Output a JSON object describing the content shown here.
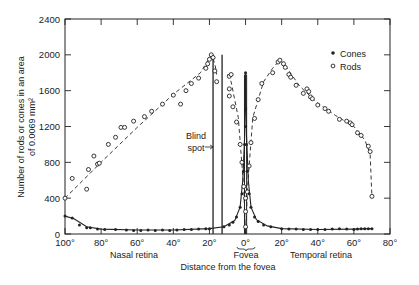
{
  "chart_data": {
    "type": "scatter",
    "title": "",
    "xlabel": "Distance from the fovea",
    "ylabel": "Number of rods or cones in an area of 0.0069 mm²",
    "ylabel_lines": [
      "Number of rods or cones in an area",
      "of 0.0069 mm²"
    ],
    "xlim": [
      -100,
      80
    ],
    "ylim": [
      0,
      2400
    ],
    "x_ticks": [
      {
        "value": -100,
        "label": "100°"
      },
      {
        "value": -80,
        "label": "80°"
      },
      {
        "value": -60,
        "label": "60°"
      },
      {
        "value": -40,
        "label": "40°"
      },
      {
        "value": -20,
        "label": "20°"
      },
      {
        "value": 0,
        "label": "0°"
      },
      {
        "value": 20,
        "label": "20°"
      },
      {
        "value": 40,
        "label": "40°"
      },
      {
        "value": 60,
        "label": "60°"
      },
      {
        "value": 80,
        "label": "80°"
      }
    ],
    "y_ticks": [
      {
        "value": 0,
        "label": "0"
      },
      {
        "value": 400,
        "label": "400"
      },
      {
        "value": 800,
        "label": "800"
      },
      {
        "value": 1200,
        "label": "1200"
      },
      {
        "value": 1600,
        "label": "1600"
      },
      {
        "value": 2000,
        "label": "2000"
      },
      {
        "value": 2400,
        "label": "2400"
      }
    ],
    "region_labels": {
      "nasal": "Nasal retina",
      "fovea": "Fovea",
      "temporal": "Temporal retina"
    },
    "annotations": [
      {
        "text": "Blind spot",
        "lines": [
          "Blind",
          "spot"
        ],
        "x_range": [
          -18,
          -13
        ]
      }
    ],
    "legend": {
      "position": "top-right",
      "entries": [
        {
          "name": "Cones",
          "marker": "filled-circle"
        },
        {
          "name": "Rods",
          "marker": "open-circle"
        }
      ]
    },
    "grid": false,
    "series": [
      {
        "name": "Rods",
        "marker": "open-circle",
        "line": "dashed",
        "points": [
          [
            -100,
            400
          ],
          [
            -96,
            620
          ],
          [
            -88,
            500
          ],
          [
            -87,
            720
          ],
          [
            -84,
            870
          ],
          [
            -82,
            780
          ],
          [
            -81,
            790
          ],
          [
            -76,
            1000
          ],
          [
            -72,
            1080
          ],
          [
            -69,
            1190
          ],
          [
            -67,
            1190
          ],
          [
            -62,
            1260
          ],
          [
            -56,
            1310
          ],
          [
            -52,
            1370
          ],
          [
            -46,
            1450
          ],
          [
            -40,
            1550
          ],
          [
            -36,
            1450
          ],
          [
            -33,
            1600
          ],
          [
            -30,
            1680
          ],
          [
            -26,
            1740
          ],
          [
            -22,
            1850
          ],
          [
            -21,
            1900
          ],
          [
            -20,
            1950
          ],
          [
            -19,
            2000
          ],
          [
            -18,
            1970
          ],
          [
            -17,
            1820
          ],
          [
            -16,
            1700
          ],
          [
            -9,
            1760
          ],
          [
            -8,
            1780
          ],
          [
            -9,
            1620
          ],
          [
            -9,
            1540
          ],
          [
            -7,
            1420
          ],
          [
            -5,
            1250
          ],
          [
            -3,
            1000
          ],
          [
            -2,
            800
          ],
          [
            -1,
            530
          ],
          [
            0,
            400
          ],
          [
            0,
            250
          ],
          [
            0,
            80
          ],
          [
            1,
            470
          ],
          [
            2,
            760
          ],
          [
            3,
            1020
          ],
          [
            5,
            1290
          ],
          [
            7,
            1500
          ],
          [
            9,
            1680
          ],
          [
            15,
            1800
          ],
          [
            18,
            1920
          ],
          [
            19,
            1940
          ],
          [
            21,
            1900
          ],
          [
            22,
            1860
          ],
          [
            24,
            1780
          ],
          [
            25,
            1750
          ],
          [
            28,
            1660
          ],
          [
            32,
            1570
          ],
          [
            34,
            1620
          ],
          [
            35,
            1590
          ],
          [
            36,
            1530
          ],
          [
            37,
            1510
          ],
          [
            40,
            1440
          ],
          [
            44,
            1400
          ],
          [
            46,
            1370
          ],
          [
            52,
            1280
          ],
          [
            56,
            1260
          ],
          [
            58,
            1240
          ],
          [
            59,
            1220
          ],
          [
            62,
            1130
          ],
          [
            64,
            1100
          ],
          [
            68,
            980
          ],
          [
            69,
            920
          ],
          [
            70,
            420
          ]
        ],
        "curve": [
          [
            -100,
            400
          ],
          [
            -80,
            800
          ],
          [
            -60,
            1190
          ],
          [
            -40,
            1560
          ],
          [
            -25,
            1800
          ],
          [
            -19,
            2000
          ],
          [
            -17,
            1900
          ],
          [
            -16,
            1780
          ],
          [
            -10,
            1780
          ],
          [
            -8,
            1700
          ],
          [
            -4,
            1300
          ],
          [
            -1,
            500
          ],
          [
            0,
            0
          ],
          [
            1,
            500
          ],
          [
            4,
            1300
          ],
          [
            10,
            1700
          ],
          [
            15,
            1850
          ],
          [
            19,
            1940
          ],
          [
            22,
            1880
          ],
          [
            30,
            1650
          ],
          [
            40,
            1460
          ],
          [
            50,
            1320
          ],
          [
            60,
            1200
          ],
          [
            66,
            1050
          ],
          [
            69,
            900
          ],
          [
            70,
            420
          ]
        ]
      },
      {
        "name": "Cones",
        "marker": "filled-circle",
        "line": "solid",
        "points": [
          [
            -100,
            200
          ],
          [
            -96,
            180
          ],
          [
            -92,
            100
          ],
          [
            -88,
            70
          ],
          [
            -86,
            70
          ],
          [
            -82,
            55
          ],
          [
            -78,
            50
          ],
          [
            -72,
            50
          ],
          [
            -66,
            45
          ],
          [
            -62,
            40
          ],
          [
            -58,
            40
          ],
          [
            -54,
            45
          ],
          [
            -50,
            40
          ],
          [
            -46,
            45
          ],
          [
            -42,
            40
          ],
          [
            -38,
            45
          ],
          [
            -34,
            50
          ],
          [
            -30,
            50
          ],
          [
            -26,
            55
          ],
          [
            -22,
            60
          ],
          [
            -20,
            60
          ],
          [
            -12,
            80
          ],
          [
            -9,
            100
          ],
          [
            -7,
            130
          ],
          [
            -5,
            190
          ],
          [
            -3,
            300
          ],
          [
            -2,
            450
          ],
          [
            -1,
            700
          ],
          [
            -0.5,
            1000
          ],
          [
            0,
            1800
          ],
          [
            0,
            1400
          ],
          [
            0,
            1200
          ],
          [
            0.5,
            1000
          ],
          [
            1,
            700
          ],
          [
            2,
            450
          ],
          [
            3,
            300
          ],
          [
            5,
            190
          ],
          [
            7,
            140
          ],
          [
            10,
            100
          ],
          [
            14,
            80
          ],
          [
            20,
            60
          ],
          [
            24,
            55
          ],
          [
            28,
            55
          ],
          [
            32,
            50
          ],
          [
            36,
            50
          ],
          [
            40,
            50
          ],
          [
            44,
            50
          ],
          [
            48,
            55
          ],
          [
            52,
            60
          ],
          [
            56,
            55
          ],
          [
            60,
            50
          ],
          [
            62,
            55
          ],
          [
            64,
            60
          ],
          [
            66,
            60
          ],
          [
            68,
            60
          ],
          [
            70,
            60
          ]
        ],
        "curve": [
          [
            -100,
            200
          ],
          [
            -95,
            170
          ],
          [
            -88,
            80
          ],
          [
            -80,
            55
          ],
          [
            -60,
            45
          ],
          [
            -40,
            45
          ],
          [
            -20,
            60
          ],
          [
            -12,
            80
          ],
          [
            -6,
            150
          ],
          [
            -3,
            300
          ],
          [
            -1.5,
            600
          ],
          [
            -0.5,
            1100
          ],
          [
            0,
            1800
          ],
          [
            0.5,
            1100
          ],
          [
            1.5,
            600
          ],
          [
            3,
            300
          ],
          [
            6,
            160
          ],
          [
            12,
            90
          ],
          [
            20,
            60
          ],
          [
            40,
            50
          ],
          [
            60,
            55
          ],
          [
            70,
            60
          ]
        ]
      }
    ]
  }
}
